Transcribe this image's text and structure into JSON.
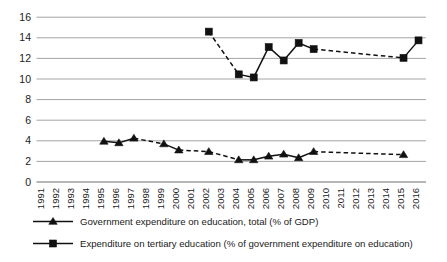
{
  "chart_data": {
    "type": "line",
    "title": "",
    "xlabel": "",
    "ylabel": "",
    "ylim": [
      0,
      16
    ],
    "ytick_step": 2,
    "yticks": [
      "0",
      "2",
      "4",
      "6",
      "8",
      "10",
      "12",
      "14",
      "16"
    ],
    "grid": true,
    "legend_position": "bottom-left",
    "categories": [
      "1991",
      "1992",
      "1993",
      "1994",
      "1995",
      "1996",
      "1997",
      "1998",
      "1999",
      "2000",
      "2001",
      "2002",
      "2003",
      "2004",
      "2005",
      "2006",
      "2007",
      "2008",
      "2009",
      "2010",
      "2011",
      "2012",
      "2013",
      "2014",
      "2015",
      "2016"
    ],
    "series": [
      {
        "name": "Government expenditure on education, total (% of GDP)",
        "marker": "triangle",
        "color": "#111111",
        "values": [
          null,
          null,
          null,
          null,
          3.95,
          3.8,
          4.25,
          null,
          3.7,
          3.1,
          null,
          2.95,
          null,
          2.15,
          2.15,
          2.5,
          2.7,
          2.35,
          2.95,
          null,
          null,
          null,
          null,
          null,
          2.65,
          null
        ]
      },
      {
        "name": "Expenditure on tertiary education (% of government expenditure on education)",
        "marker": "square",
        "color": "#111111",
        "values": [
          null,
          null,
          null,
          null,
          null,
          null,
          null,
          null,
          null,
          null,
          null,
          14.6,
          null,
          10.45,
          10.15,
          13.1,
          11.8,
          13.5,
          12.9,
          null,
          null,
          null,
          null,
          null,
          12.05,
          13.75
        ]
      }
    ]
  },
  "legend": {
    "items": [
      {
        "label": "Government expenditure on education, total (% of GDP)",
        "marker": "triangle-marker-icon"
      },
      {
        "label": "Expenditure on tertiary education (% of government expenditure on education)",
        "marker": "square-marker-icon"
      }
    ]
  }
}
